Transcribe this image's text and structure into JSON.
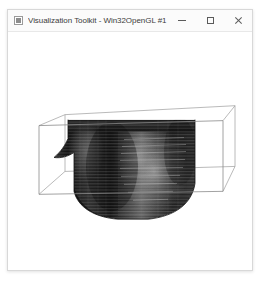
{
  "window": {
    "title": "Visualization Toolkit - Win32OpenGL #1",
    "icon": "app-window-icon",
    "background_color": "#ffffff",
    "titlebar_color": "#fbfbfb",
    "border_color": "#d8d8d8",
    "controls": {
      "minimize_label": "Minimize",
      "maximize_label": "Maximize",
      "close_label": "Close",
      "minimize_icon": "minimize-icon",
      "maximize_icon": "maximize-icon",
      "close_icon": "close-icon"
    }
  },
  "render": {
    "background_color": "#ffffff",
    "outline_color": "#8a8a8a",
    "volume_color_dark": "#1a1a1a",
    "volume_color_mid": "#4a4a4a",
    "volume_color_light": "#9e9e9e",
    "scene_description": "Volume rendered dataset inside wireframe outline box",
    "actors": [
      {
        "name": "outline-box",
        "type": "wireframe-cube"
      },
      {
        "name": "volume",
        "type": "volume-rendering"
      }
    ]
  }
}
